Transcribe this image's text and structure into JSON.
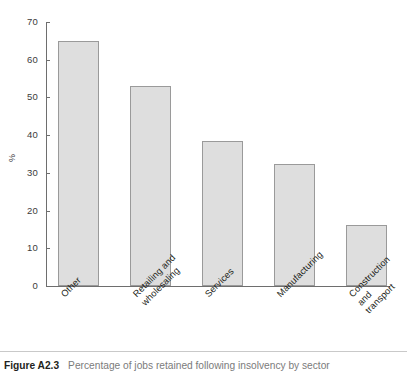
{
  "figure": {
    "caption_label": "Figure A2.3",
    "caption_text": "Percentage of jobs retained following insolvency by sector"
  },
  "chart_data": {
    "type": "bar",
    "title": "",
    "subtitle": "",
    "xlabel": "",
    "ylabel": "%",
    "categories": [
      "Other",
      "Retailing and\nwholesaling",
      "Services",
      "Manufacturing",
      "Construction and\ntransport"
    ],
    "values": [
      65.0,
      53.0,
      38.5,
      32.3,
      16.2
    ],
    "ylim": [
      0,
      70
    ],
    "yticks": [
      0,
      10,
      20,
      30,
      40,
      50,
      60,
      70
    ],
    "ytick_labels": [
      "0",
      "10",
      "20",
      "30",
      "40",
      "50",
      "60",
      "70"
    ],
    "grid": false,
    "legend": false,
    "bar_fill": "#dedede",
    "bar_border": "#9a9a9a",
    "axis_color": "#6e6e6e"
  }
}
